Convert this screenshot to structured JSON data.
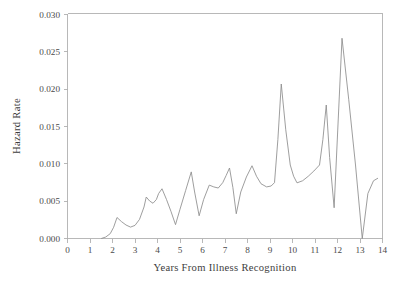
{
  "chart_data": {
    "type": "line",
    "title": "",
    "xlabel": "Years From Illness Recognition",
    "ylabel": "Hazard Rate",
    "xlim": [
      0,
      14
    ],
    "ylim": [
      0,
      0.03
    ],
    "xticks": [
      0,
      1,
      2,
      3,
      4,
      5,
      6,
      7,
      8,
      9,
      10,
      11,
      12,
      13,
      14
    ],
    "xtick_labels": [
      "0",
      "1",
      "2",
      "3",
      "4",
      "5",
      "6",
      "7",
      "8",
      "9",
      "10",
      "11",
      "12",
      "13",
      "14"
    ],
    "yticks": [
      0.0,
      0.005,
      0.01,
      0.015,
      0.02,
      0.025,
      0.03
    ],
    "ytick_labels": [
      "0.000",
      "0.005",
      "0.010",
      "0.015",
      "0.020",
      "0.025",
      "0.030"
    ],
    "grid": false,
    "legend": false,
    "line_color": "#8c8c8c",
    "series": [
      {
        "name": "Hazard Rate",
        "x": [
          1.5,
          1.7,
          1.9,
          2.05,
          2.2,
          2.4,
          2.6,
          2.8,
          3.0,
          3.2,
          3.4,
          3.5,
          3.65,
          3.8,
          3.95,
          4.05,
          4.2,
          4.4,
          4.6,
          4.8,
          5.0,
          5.25,
          5.5,
          5.65,
          5.85,
          6.05,
          6.3,
          6.5,
          6.7,
          6.9,
          7.05,
          7.2,
          7.35,
          7.5,
          7.7,
          7.95,
          8.2,
          8.4,
          8.6,
          8.85,
          9.05,
          9.2,
          9.35,
          9.5,
          9.7,
          9.9,
          10.05,
          10.2,
          10.45,
          10.7,
          10.95,
          11.2,
          11.35,
          11.5,
          11.65,
          11.85,
          12.0,
          12.2,
          12.5,
          12.8,
          13.1,
          13.35,
          13.6,
          13.8
        ],
        "y": [
          0.0,
          0.0002,
          0.00065,
          0.0015,
          0.0028,
          0.00225,
          0.0018,
          0.00152,
          0.00175,
          0.00255,
          0.0042,
          0.00553,
          0.005,
          0.0047,
          0.0052,
          0.006,
          0.00663,
          0.0052,
          0.0036,
          0.00185,
          0.0039,
          0.0064,
          0.00888,
          0.0062,
          0.00303,
          0.0052,
          0.00712,
          0.00688,
          0.00673,
          0.00745,
          0.0084,
          0.0094,
          0.0068,
          0.0033,
          0.0062,
          0.0082,
          0.0097,
          0.0083,
          0.0073,
          0.00688,
          0.007,
          0.00745,
          0.0132,
          0.0206,
          0.0145,
          0.0098,
          0.0083,
          0.00742,
          0.0077,
          0.0083,
          0.009,
          0.0098,
          0.0132,
          0.0178,
          0.0108,
          0.0041,
          0.0138,
          0.0267,
          0.0185,
          0.0098,
          0.0,
          0.006,
          0.0077,
          0.00805
        ]
      }
    ]
  },
  "axes": {
    "y_label": "Hazard Rate",
    "x_label": "Years From Illness Recognition"
  },
  "figure": {
    "background_color": "#ffffff",
    "axis_color": "#b0b0b0",
    "text_color": "#444444"
  }
}
